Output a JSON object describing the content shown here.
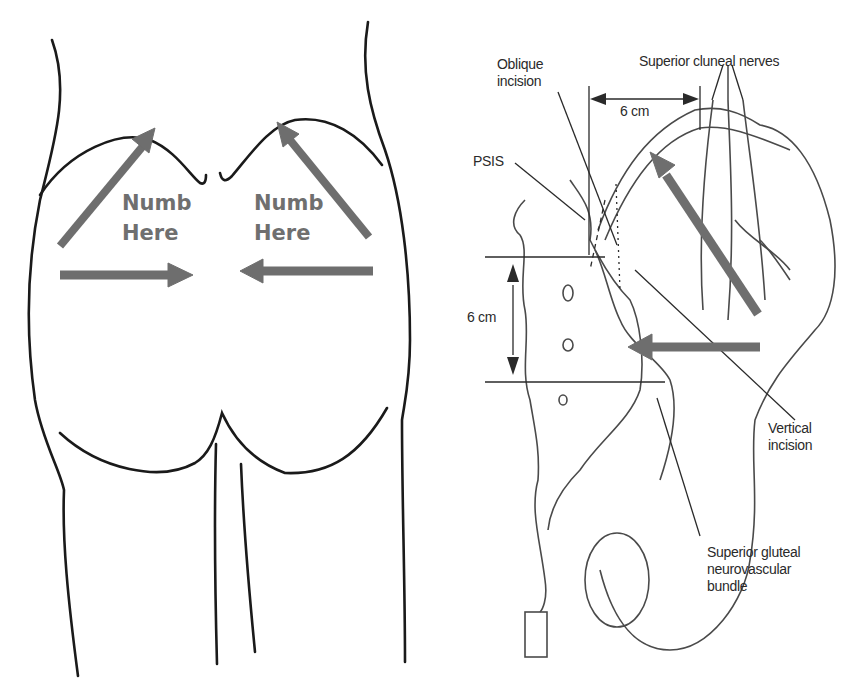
{
  "figure": {
    "left_panel": {
      "description": "Posterior view outline of buttocks with gray arrows indicating numb regions",
      "labels": [
        {
          "line1": "Numb",
          "line2": "Here"
        },
        {
          "line1": "Numb",
          "line2": "Here"
        }
      ],
      "arrow_color": "#6e6e6e",
      "line_color": "#1a1a1a"
    },
    "right_panel": {
      "description": "Anatomical illustration of pelvis showing incision sites and nerves",
      "labels": {
        "oblique_incision_1": "Oblique",
        "oblique_incision_2": "incision",
        "superior_cluneal": "Superior cluneal nerves",
        "horizontal_distance": "6 cm",
        "psis": "PSIS",
        "vertical_distance": "6 cm",
        "vertical_incision_1": "Vertical",
        "vertical_incision_2": "incision",
        "gluteal_1": "Superior gluteal",
        "gluteal_2": "neurovascular",
        "gluteal_3": "bundle"
      },
      "arrow_color": "#6e6e6e",
      "line_color": "#3a3a3a"
    }
  }
}
